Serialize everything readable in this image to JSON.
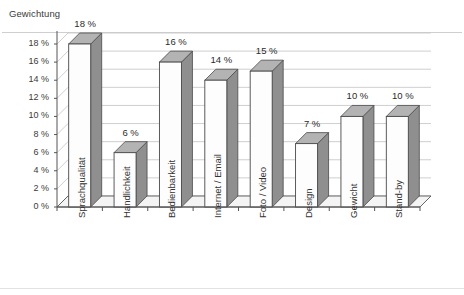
{
  "chart_data": {
    "type": "bar",
    "title": "",
    "ylabel": "Gewichtung",
    "xlabel": "",
    "categories": [
      "Sprachqualität",
      "Handlichkeit",
      "Bedienbarkeit",
      "Internet / Email",
      "Foto / Video",
      "Design",
      "Gewicht",
      "Stand-by"
    ],
    "values": [
      18,
      6,
      16,
      14,
      15,
      7,
      10,
      10
    ],
    "data_labels": [
      "18 %",
      "6 %",
      "16 %",
      "14 %",
      "15 %",
      "7 %",
      "10 %",
      "10 %"
    ],
    "ylim": [
      0,
      18
    ],
    "ytick_values": [
      0,
      2,
      4,
      6,
      8,
      10,
      12,
      14,
      16,
      18
    ],
    "ytick_labels": [
      "0 %",
      "2 %",
      "4 %",
      "6 %",
      "8 %",
      "10 %",
      "12 %",
      "14 %",
      "16 %",
      "18 %"
    ],
    "grid": true,
    "legend": false,
    "style": "3d-column",
    "unit": "%",
    "colors": {
      "bar_front": "#fdfdfd",
      "bar_top": "#b3b3b3",
      "bar_side": "#8f8f8f",
      "bar_outline": "#4a4a4a",
      "gridline": "#c9c9c9",
      "axis": "#555555",
      "floor": "#f4f4f4",
      "text": "#2b2b2b",
      "background": "#ffffff"
    }
  }
}
